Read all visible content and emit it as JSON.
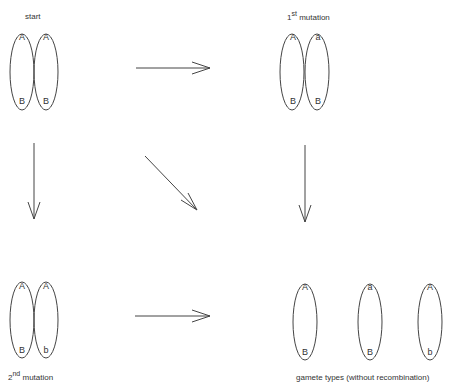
{
  "labels": {
    "start": "start",
    "first_mutation_num": "1",
    "first_mutation_sup": "st",
    "first_mutation_text": " mutation",
    "second_mutation_num": "2",
    "second_mutation_sup": "nd",
    "second_mutation_text": " mutation",
    "gametes": "gamete types (without recombination)"
  },
  "panels": {
    "start": {
      "chrom1": {
        "top": "A",
        "bottom": "B"
      },
      "chrom2": {
        "top": "A",
        "bottom": "B"
      }
    },
    "first_mutation": {
      "chrom1": {
        "top": "A",
        "bottom": "B"
      },
      "chrom2": {
        "top": "a",
        "bottom": "B"
      }
    },
    "second_mutation": {
      "chrom1": {
        "top": "A",
        "bottom": "B"
      },
      "chrom2": {
        "top": "A",
        "bottom": "b"
      }
    },
    "gametes": [
      {
        "top": "A",
        "bottom": "B"
      },
      {
        "top": "a",
        "bottom": "B"
      },
      {
        "top": "A",
        "bottom": "b"
      }
    ]
  },
  "colors": {
    "stroke": "#444444",
    "text": "#333333"
  }
}
